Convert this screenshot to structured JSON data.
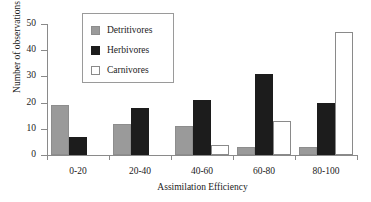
{
  "chart_data": {
    "type": "bar",
    "title": "",
    "xlabel": "Assimilation Efficiency",
    "ylabel": "Number of observations",
    "categories": [
      "0-20",
      "20-40",
      "40-60",
      "60-80",
      "80-100"
    ],
    "ylim": [
      0,
      50
    ],
    "yticks": [
      0,
      10,
      20,
      30,
      40,
      50
    ],
    "ytick_labels": [
      "0",
      "10",
      "20",
      "30",
      "40",
      "50"
    ],
    "grid": false,
    "legend_position": "upper-left-inside",
    "series": [
      {
        "name": "Detritivores",
        "color": "#9a9a9a",
        "values": [
          19,
          12,
          11,
          3,
          3
        ]
      },
      {
        "name": "Herbivores",
        "color": "#1c1c1c",
        "values": [
          7,
          18,
          21,
          31,
          20
        ]
      },
      {
        "name": "Carnivores",
        "color": "#ffffff",
        "values": [
          0,
          0,
          4,
          13,
          47
        ]
      }
    ]
  }
}
